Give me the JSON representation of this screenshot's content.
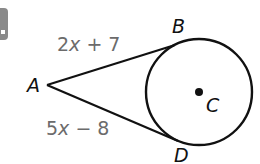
{
  "figure": {
    "badge": {
      "color": "#8a8a8a"
    },
    "circle": {
      "center_label": "C",
      "cx": 199,
      "cy": 92,
      "r": 53
    },
    "points": {
      "A": {
        "label": "A",
        "x": 47,
        "y": 85
      },
      "B": {
        "label": "B",
        "x": 175,
        "y": 45
      },
      "C": {
        "label": "C",
        "x": 199,
        "y": 92
      },
      "D": {
        "label": "D",
        "x": 178,
        "y": 141
      }
    },
    "segments": {
      "AB": {
        "label_coef": "2",
        "label_var": "x",
        "label_rest": " + 7",
        "full": "2x + 7"
      },
      "AD": {
        "label_coef": "5",
        "label_var": "x",
        "label_rest": " − 8",
        "full": "5x − 8"
      }
    },
    "colors": {
      "line": "#111111",
      "expression": "#6b6b6b"
    }
  }
}
